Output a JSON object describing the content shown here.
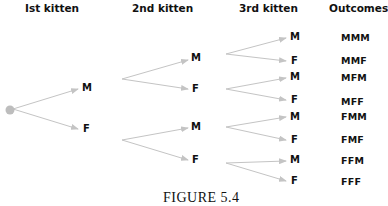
{
  "headers": {
    "first": "Ist kitten",
    "second": "2nd kitten",
    "third": "3rd kitten",
    "outcomes": "Outcomes"
  },
  "tree": {
    "root": {
      "color": "#bdbdbd"
    },
    "branch_color": "#c4c4c4",
    "level1": [
      "M",
      "F"
    ],
    "level2": [
      "M",
      "F",
      "M",
      "F"
    ],
    "level3": [
      "M",
      "F",
      "M",
      "F",
      "M",
      "F",
      "M",
      "F"
    ]
  },
  "outcomes": [
    "MMM",
    "MMF",
    "MFM",
    "MFF",
    "FMM",
    "FMF",
    "FFM",
    "FFF"
  ],
  "caption": "FIGURE 5.4"
}
